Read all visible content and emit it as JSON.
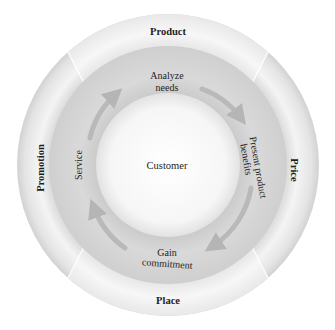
{
  "diagram": {
    "center": {
      "label": "Customer"
    },
    "outer_ring": {
      "segments": [
        {
          "id": "product",
          "label": "Product",
          "position": "top"
        },
        {
          "id": "price",
          "label": "Price",
          "position": "right"
        },
        {
          "id": "place",
          "label": "Place",
          "position": "bottom"
        },
        {
          "id": "promotion",
          "label": "Promotion",
          "position": "left"
        }
      ]
    },
    "middle_ring": {
      "steps": [
        {
          "id": "analyze",
          "line1": "Analyze",
          "line2": "needs",
          "position": "top"
        },
        {
          "id": "present",
          "line1": "Present product",
          "line2": "benefits",
          "position": "right"
        },
        {
          "id": "gain",
          "line1": "Gain",
          "line2": "commitment",
          "position": "bottom"
        },
        {
          "id": "service",
          "line1": "Service",
          "line2": "",
          "position": "left"
        }
      ],
      "flow_direction": "clockwise"
    },
    "colors": {
      "outer_ring_light": "#f3f3f3",
      "outer_ring_mid": "#e0e0e0",
      "middle_ring": "#d6d6d6",
      "arrow": "#b9b9b9",
      "center": "#fbfbfb",
      "text": "#1e1e1e"
    }
  }
}
